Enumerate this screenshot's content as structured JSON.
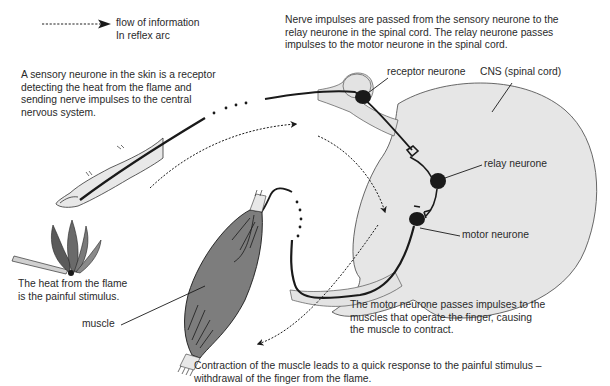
{
  "legend": {
    "label_line1": "flow of information",
    "label_line2": "In reflex arc"
  },
  "captions": {
    "sensory": [
      "A sensory neurone in the skin is a receptor",
      "detecting the heat from the flame and",
      "sending nerve impulses to the central",
      "nervous system."
    ],
    "relay": [
      "Nerve impulses are passed from the sensory neurone to the",
      "relay neurone in the spinal cord. The relay neurone passes",
      "impulses to the motor neurone in the spinal cord."
    ],
    "stimulus": [
      "The heat from the flame",
      "is the painful stimulus."
    ],
    "motor": [
      "The motor neurone passes impulses to the",
      "muscles that operate the finger, causing",
      "the muscle to contract."
    ],
    "response": [
      "Contraction of the muscle leads to a quick response to the painful stimulus –",
      "withdrawal of the finger from the flame."
    ]
  },
  "labels": {
    "receptor_neurone": "receptor neurone",
    "cns": "CNS (spinal cord)",
    "relay_neurone": "relay neurone",
    "motor_neurone": "motor neurone",
    "muscle": "muscle"
  },
  "colors": {
    "cns_fill": "#e6e6e6",
    "nerve_fill": "#e3e3e3",
    "finger_fill": "#e8e8e8",
    "muscle_fill": "#7d7d7d",
    "neurone": "#1a1a1a",
    "text": "#2a2a2a"
  }
}
